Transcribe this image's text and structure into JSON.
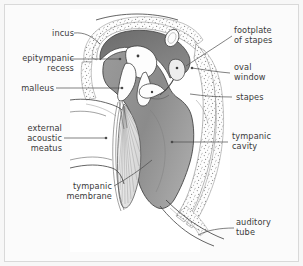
{
  "figure": {
    "background_color": "#f7f7f7",
    "panel_color": "#ffffff",
    "frame_border_color": "#d9d9d9",
    "ink_color": "#3d3d3d",
    "label_color": "#3a3a3a"
  },
  "labels": {
    "incus": "incus",
    "epitympanic_recess": "epitympanic\nrecess",
    "malleus": "malleus",
    "external_acoustic_meatus": "external\nacoustic\nmeatus",
    "tympanic_membrane": "tympanic\nmembrane",
    "footplate_of_stapes": "footplate\nof stapes",
    "oval_window": "oval\nwindow",
    "stapes": "stapes",
    "tympanic_cavity": "tympanic\ncavity",
    "auditory_tube": "auditory\ntube"
  },
  "structures": {
    "tympanic_cavity_fill": "#8d8d8d",
    "epitympanic_fill": "#6f6f6f",
    "ossicle_fill": "#fdfdfd",
    "bone_stipple_color": "#8a8a8a",
    "membrane_fill": "#e8e8e8"
  }
}
